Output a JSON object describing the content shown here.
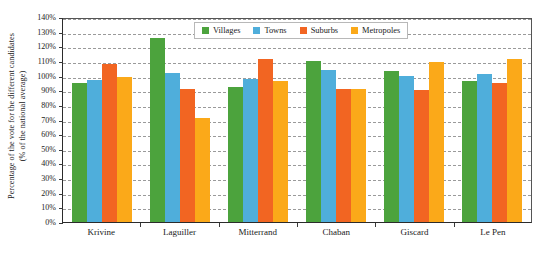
{
  "chart_data": {
    "type": "bar",
    "title": "",
    "xlabel": "",
    "ylabel": "Percentage of the vote for the different candidates (% of the national average)",
    "ylabel_line1": "Percentage of the vote for the different candidates",
    "ylabel_line2": "(% of the national average)",
    "ylim": [
      0,
      140
    ],
    "y_tick_step": 10,
    "y_tick_labels": [
      "0%",
      "10%",
      "20%",
      "30%",
      "40%",
      "50%",
      "60%",
      "70%",
      "80%",
      "90%",
      "100%",
      "110%",
      "120%",
      "130%",
      "140%"
    ],
    "grid": true,
    "grid_axis": "y",
    "legend_position": "top-center",
    "categories": [
      "Krivine",
      "Laguiller",
      "Mitterrand",
      "Chaban",
      "Giscard",
      "Le Pen"
    ],
    "series": [
      {
        "name": "Villages",
        "color": "#4CA33D",
        "values": [
          95,
          126,
          92,
          110,
          103,
          96
        ]
      },
      {
        "name": "Towns",
        "color": "#4FAEDB",
        "values": [
          97,
          102,
          98,
          104,
          100,
          101
        ]
      },
      {
        "name": "Suburbs",
        "color": "#F26522",
        "values": [
          108,
          91,
          111,
          91,
          90,
          95
        ]
      },
      {
        "name": "Metropoles",
        "color": "#FBA919",
        "values": [
          99,
          71,
          96,
          91,
          109,
          111
        ]
      }
    ]
  }
}
